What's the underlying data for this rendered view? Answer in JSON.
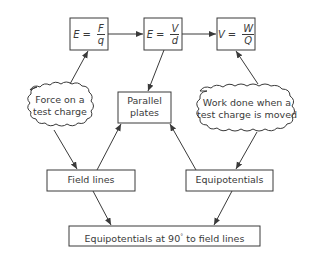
{
  "diagram": {
    "formulas": [
      {
        "id": "field_force",
        "lhs": "E",
        "eq": "=",
        "num": "F",
        "den": "q"
      },
      {
        "id": "field_voltage",
        "lhs": "E",
        "eq": "=",
        "num": "V",
        "den": "d"
      },
      {
        "id": "potential",
        "lhs": "V",
        "eq": "=",
        "num": "W",
        "den": "Q"
      }
    ],
    "clouds": {
      "force": {
        "line1": "Force on a",
        "line2": "test charge"
      },
      "work": {
        "line1": "Work done when a",
        "line2": "test charge is moved"
      }
    },
    "boxes": {
      "parallel_plates": {
        "line1": "Parallel",
        "line2": "plates"
      },
      "field_lines": "Field lines",
      "equipotentials": "Equipotentials",
      "conclusion": {
        "text": "Equipotentials at 90",
        "sup": "°",
        "rest": " to field lines"
      }
    },
    "colors": {
      "stroke": "#3a3a3a",
      "background": "#ffffff"
    }
  }
}
